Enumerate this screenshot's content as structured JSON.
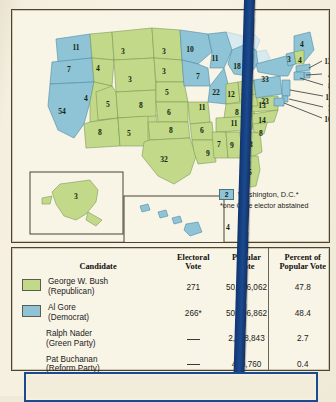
{
  "map": {
    "title": "2000 Presidential Election Electoral Map",
    "colors": {
      "bush_green": "#c3d98a",
      "gore_blue": "#8fc3d6",
      "water": "#d8e9f0",
      "paper": "#f8f4e6",
      "border": "#4a4336",
      "accent_blue": "#1b4a91"
    },
    "states": [
      {
        "code": "WA",
        "label": "11",
        "party": "gore",
        "x": 64,
        "y": 41
      },
      {
        "code": "OR",
        "label": "7",
        "party": "gore",
        "x": 57,
        "y": 63
      },
      {
        "code": "CA",
        "label": "54",
        "party": "gore",
        "x": 50,
        "y": 105
      },
      {
        "code": "NV",
        "label": "4",
        "party": "bush",
        "x": 74,
        "y": 92
      },
      {
        "code": "ID",
        "label": "4",
        "party": "bush",
        "x": 86,
        "y": 62
      },
      {
        "code": "MT",
        "label": "3",
        "party": "bush",
        "x": 111,
        "y": 45
      },
      {
        "code": "WY",
        "label": "3",
        "party": "bush",
        "x": 118,
        "y": 73
      },
      {
        "code": "UT",
        "label": "5",
        "party": "bush",
        "x": 96,
        "y": 98
      },
      {
        "code": "AZ",
        "label": "8",
        "party": "bush",
        "x": 88,
        "y": 126
      },
      {
        "code": "CO",
        "label": "8",
        "party": "bush",
        "x": 129,
        "y": 99
      },
      {
        "code": "NM",
        "label": "5",
        "party": "bush",
        "x": 117,
        "y": 127
      },
      {
        "code": "ND",
        "label": "3",
        "party": "bush",
        "x": 152,
        "y": 45
      },
      {
        "code": "SD",
        "label": "3",
        "party": "bush",
        "x": 152,
        "y": 65
      },
      {
        "code": "NE",
        "label": "5",
        "party": "bush",
        "x": 155,
        "y": 86
      },
      {
        "code": "KS",
        "label": "6",
        "party": "bush",
        "x": 157,
        "y": 106
      },
      {
        "code": "OK",
        "label": "8",
        "party": "bush",
        "x": 159,
        "y": 124
      },
      {
        "code": "TX",
        "label": "32",
        "party": "bush",
        "x": 152,
        "y": 153
      },
      {
        "code": "MN",
        "label": "10",
        "party": "gore",
        "x": 178,
        "y": 43
      },
      {
        "code": "IA",
        "label": "7",
        "party": "gore",
        "x": 186,
        "y": 70
      },
      {
        "code": "MO",
        "label": "11",
        "party": "bush",
        "x": 190,
        "y": 101
      },
      {
        "code": "AR",
        "label": "6",
        "party": "bush",
        "x": 190,
        "y": 124
      },
      {
        "code": "LA",
        "label": "9",
        "party": "bush",
        "x": 196,
        "y": 147
      },
      {
        "code": "WI",
        "label": "11",
        "party": "gore",
        "x": 203,
        "y": 52
      },
      {
        "code": "IL",
        "label": "22",
        "party": "gore",
        "x": 204,
        "y": 86
      },
      {
        "code": "MI",
        "label": "18",
        "party": "gore",
        "x": 225,
        "y": 60
      },
      {
        "code": "IN",
        "label": "12",
        "party": "bush",
        "x": 219,
        "y": 88
      },
      {
        "code": "OH",
        "label": "21",
        "party": "bush",
        "x": 233,
        "y": 86
      },
      {
        "code": "KY",
        "label": "8",
        "party": "bush",
        "x": 225,
        "y": 106
      },
      {
        "code": "TN",
        "label": "11",
        "party": "bush",
        "x": 222,
        "y": 117
      },
      {
        "code": "MS",
        "label": "7",
        "party": "bush",
        "x": 207,
        "y": 138
      },
      {
        "code": "AL",
        "label": "9",
        "party": "bush",
        "x": 220,
        "y": 139
      },
      {
        "code": "GA",
        "label": "13",
        "party": "bush",
        "x": 237,
        "y": 138
      },
      {
        "code": "SC",
        "label": "8",
        "party": "bush",
        "x": 249,
        "y": 127
      },
      {
        "code": "NC",
        "label": "14",
        "party": "bush",
        "x": 250,
        "y": 114
      },
      {
        "code": "VA",
        "label": "13",
        "party": "bush",
        "x": 250,
        "y": 99
      },
      {
        "code": "WV",
        "label": "5",
        "party": "bush",
        "x": 238,
        "y": 97
      },
      {
        "code": "FL",
        "label": "25",
        "party": "bush",
        "x": 236,
        "y": 166
      },
      {
        "code": "PA",
        "label": "23",
        "party": "gore",
        "x": 253,
        "y": 95
      },
      {
        "code": "NY",
        "label": "33",
        "party": "gore",
        "x": 253,
        "y": 73
      },
      {
        "code": "ME",
        "label": "4",
        "party": "gore",
        "x": 290,
        "y": 38
      },
      {
        "code": "VT",
        "label": "3",
        "party": "gore",
        "x": 277,
        "y": 53
      },
      {
        "code": "NH",
        "label": "4",
        "party": "bush",
        "x": 288,
        "y": 54
      },
      {
        "code": "AK",
        "label": "3",
        "party": "bush",
        "x": 64,
        "y": 190
      },
      {
        "code": "HI",
        "label": "4",
        "party": "gore",
        "x": 216,
        "y": 221
      }
    ],
    "leader_labels": [
      {
        "label": "12",
        "x": 316,
        "y": 55,
        "state": "MA"
      },
      {
        "label": "4",
        "x": 318,
        "y": 69,
        "state": "RI"
      },
      {
        "label": "8",
        "x": 318,
        "y": 80,
        "state": "CT"
      },
      {
        "label": "15",
        "x": 317,
        "y": 91,
        "state": "NJ"
      },
      {
        "label": "3",
        "x": 318,
        "y": 102,
        "state": "DE"
      },
      {
        "label": "10",
        "x": 316,
        "y": 113,
        "state": "MD"
      }
    ],
    "dc_legend": {
      "value": "2",
      "label": "Washington, D.C.*",
      "footnote": "*one Gore elector abstained"
    }
  },
  "table": {
    "headers": {
      "candidate": "Candidate",
      "electoral_vote_l1": "Electoral",
      "electoral_vote_l2": "Vote",
      "popular_vote_l1": "Popular",
      "popular_vote_l2": "Vote",
      "percent_l1": "Percent of",
      "percent_l2": "Popular Vote"
    },
    "rows": [
      {
        "swatch": "green",
        "name": "George W. Bush",
        "party": "(Republican)",
        "electoral_vote": "271",
        "popular_vote": "50,456,062",
        "percent": "47.8"
      },
      {
        "swatch": "blue",
        "name": "Al Gore",
        "party": "(Democrat)",
        "electoral_vote": "266*",
        "popular_vote": "50,996,862",
        "percent": "48.4"
      },
      {
        "swatch": "none",
        "name": "Ralph Nader",
        "party": "(Green Party)",
        "electoral_vote": "—",
        "popular_vote": "2,858,843",
        "percent": "2.7"
      },
      {
        "swatch": "none",
        "name": "Pat Buchanan",
        "party": "(Reform Party)",
        "electoral_vote": "—",
        "popular_vote": "438,760",
        "percent": "0.4"
      }
    ]
  }
}
